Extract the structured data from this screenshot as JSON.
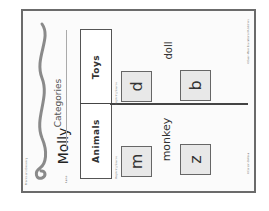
{
  "worksheet": {
    "series_label": "Phonics and Decoding",
    "title": "Categories",
    "name_label": "Name",
    "student_name": "Molly",
    "categories": [
      {
        "label": "Toys"
      },
      {
        "label": "Animals"
      }
    ],
    "beginning_sounds_label": "Beginning Sounds",
    "columns": {
      "toys": {
        "word": "doll",
        "letters": [
          "d",
          "b"
        ]
      },
      "animals": {
        "word": "monkey",
        "letters": [
          "m",
          "z"
        ]
      }
    },
    "footer_left": "©Carson-Dellosa",
    "footer_right": "©Evan-Moor Educational Publishers"
  },
  "colors": {
    "border": "#6b6b6b",
    "letter_box_fill": "#e8e8e8",
    "text": "#333333"
  }
}
